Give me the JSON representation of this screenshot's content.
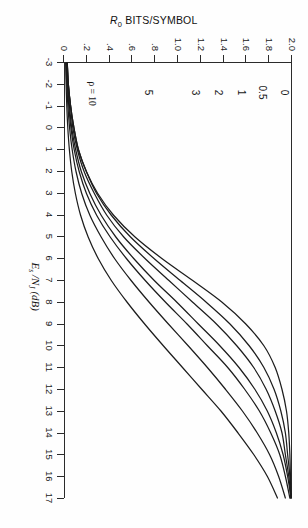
{
  "figure": {
    "background_color": "#fefefe",
    "line_color": "#1c1c1c"
  },
  "chart_data": {
    "type": "line",
    "title": "",
    "xlabel": "Es /NJ (dB)",
    "ylabel": "R0 BITS/SYMBOL",
    "xlim": [
      -3,
      17
    ],
    "ylim": [
      0,
      2.0
    ],
    "grid": false,
    "legend_position": "inline-curve-labels",
    "xticks": [
      -3,
      -2,
      -1,
      0,
      1,
      2,
      3,
      4,
      5,
      6,
      7,
      8,
      9,
      10,
      11,
      12,
      13,
      14,
      15,
      16,
      17
    ],
    "xticklabels": [
      "-3",
      "-2",
      "-1",
      "0",
      "1",
      "2",
      "3",
      "4",
      "5",
      "6",
      "7",
      "8",
      "9",
      "10",
      "11",
      "12",
      "13",
      "14",
      "15",
      "16",
      "17"
    ],
    "yticks": [
      0,
      0.2,
      0.4,
      0.6,
      0.8,
      1.0,
      1.2,
      1.4,
      1.6,
      1.8,
      2.0
    ],
    "yticklabels": [
      "0",
      ".2",
      ".4",
      ".6",
      ".8",
      "1.0",
      "1.2",
      "1.4",
      "1.6",
      "1.8",
      "2.0"
    ],
    "series": [
      {
        "name": "0",
        "label": "0",
        "label_x": -1.6,
        "label_y": 1.93,
        "points": [
          [
            -3,
            0.02
          ],
          [
            -2,
            0.03
          ],
          [
            -1,
            0.05
          ],
          [
            0,
            0.08
          ],
          [
            1,
            0.12
          ],
          [
            2,
            0.19
          ],
          [
            3,
            0.29
          ],
          [
            4,
            0.43
          ],
          [
            5,
            0.62
          ],
          [
            6,
            0.86
          ],
          [
            7,
            1.13
          ],
          [
            8,
            1.39
          ],
          [
            9,
            1.6
          ],
          [
            10,
            1.76
          ],
          [
            11,
            1.86
          ],
          [
            12,
            1.92
          ],
          [
            13,
            1.96
          ],
          [
            14,
            1.98
          ],
          [
            15,
            1.99
          ],
          [
            16,
            1.995
          ],
          [
            17,
            2.0
          ]
        ]
      },
      {
        "name": "0.5",
        "label": "0.5",
        "label_x": -1.6,
        "label_y": 1.74,
        "points": [
          [
            -3,
            0.02
          ],
          [
            -2,
            0.03
          ],
          [
            -1,
            0.05
          ],
          [
            0,
            0.08
          ],
          [
            1,
            0.12
          ],
          [
            2,
            0.19
          ],
          [
            3,
            0.28
          ],
          [
            4,
            0.41
          ],
          [
            5,
            0.58
          ],
          [
            6,
            0.79
          ],
          [
            7,
            1.02
          ],
          [
            8,
            1.25
          ],
          [
            9,
            1.46
          ],
          [
            10,
            1.63
          ],
          [
            11,
            1.76
          ],
          [
            12,
            1.85
          ],
          [
            13,
            1.91
          ],
          [
            14,
            1.95
          ],
          [
            15,
            1.97
          ],
          [
            16,
            1.99
          ],
          [
            17,
            2.0
          ]
        ]
      },
      {
        "name": "1",
        "label": "1",
        "label_x": -1.6,
        "label_y": 1.55,
        "points": [
          [
            -3,
            0.02
          ],
          [
            -2,
            0.03
          ],
          [
            -1,
            0.05
          ],
          [
            0,
            0.07
          ],
          [
            1,
            0.11
          ],
          [
            2,
            0.17
          ],
          [
            3,
            0.26
          ],
          [
            4,
            0.37
          ],
          [
            5,
            0.52
          ],
          [
            6,
            0.71
          ],
          [
            7,
            0.92
          ],
          [
            8,
            1.13
          ],
          [
            9,
            1.34
          ],
          [
            10,
            1.52
          ],
          [
            11,
            1.67
          ],
          [
            12,
            1.78
          ],
          [
            13,
            1.86
          ],
          [
            14,
            1.92
          ],
          [
            15,
            1.95
          ],
          [
            16,
            1.98
          ],
          [
            17,
            2.0
          ]
        ]
      },
      {
        "name": "2",
        "label": "2",
        "label_x": -1.6,
        "label_y": 1.35,
        "points": [
          [
            -3,
            0.015
          ],
          [
            -2,
            0.024
          ],
          [
            -1,
            0.04
          ],
          [
            0,
            0.06
          ],
          [
            1,
            0.095
          ],
          [
            2,
            0.145
          ],
          [
            3,
            0.22
          ],
          [
            4,
            0.32
          ],
          [
            5,
            0.45
          ],
          [
            6,
            0.61
          ],
          [
            7,
            0.79
          ],
          [
            8,
            0.99
          ],
          [
            9,
            1.18
          ],
          [
            10,
            1.37
          ],
          [
            11,
            1.54
          ],
          [
            12,
            1.68
          ],
          [
            13,
            1.79
          ],
          [
            14,
            1.87
          ],
          [
            15,
            1.93
          ],
          [
            16,
            1.97
          ],
          [
            17,
            2.0
          ]
        ]
      },
      {
        "name": "3",
        "label": "3",
        "label_x": -1.6,
        "label_y": 1.15,
        "points": [
          [
            -3,
            0.013
          ],
          [
            -2,
            0.021
          ],
          [
            -1,
            0.034
          ],
          [
            0,
            0.053
          ],
          [
            1,
            0.082
          ],
          [
            2,
            0.126
          ],
          [
            3,
            0.19
          ],
          [
            4,
            0.28
          ],
          [
            5,
            0.4
          ],
          [
            6,
            0.545
          ],
          [
            7,
            0.71
          ],
          [
            8,
            0.89
          ],
          [
            9,
            1.08
          ],
          [
            10,
            1.26
          ],
          [
            11,
            1.44
          ],
          [
            12,
            1.59
          ],
          [
            13,
            1.72
          ],
          [
            14,
            1.82
          ],
          [
            15,
            1.9
          ],
          [
            16,
            1.95
          ],
          [
            17,
            1.99
          ]
        ]
      },
      {
        "name": "5",
        "label": "5",
        "label_x": -1.6,
        "label_y": 0.74,
        "points": [
          [
            -3,
            0.01
          ],
          [
            -2,
            0.016
          ],
          [
            -1,
            0.026
          ],
          [
            0,
            0.041
          ],
          [
            1,
            0.064
          ],
          [
            2,
            0.098
          ],
          [
            3,
            0.148
          ],
          [
            4,
            0.22
          ],
          [
            5,
            0.32
          ],
          [
            6,
            0.44
          ],
          [
            7,
            0.585
          ],
          [
            8,
            0.745
          ],
          [
            9,
            0.915
          ],
          [
            10,
            1.09
          ],
          [
            11,
            1.26
          ],
          [
            12,
            1.42
          ],
          [
            13,
            1.57
          ],
          [
            14,
            1.7
          ],
          [
            15,
            1.81
          ],
          [
            16,
            1.89
          ],
          [
            17,
            1.95
          ]
        ]
      },
      {
        "name": "10",
        "label": "ρ = 10",
        "label_x": -1.55,
        "label_y": 0.25,
        "points": [
          [
            -3,
            0.006
          ],
          [
            -2,
            0.01
          ],
          [
            -1,
            0.016
          ],
          [
            0,
            0.025
          ],
          [
            1,
            0.039
          ],
          [
            2,
            0.06
          ],
          [
            3,
            0.092
          ],
          [
            4,
            0.138
          ],
          [
            5,
            0.205
          ],
          [
            6,
            0.295
          ],
          [
            7,
            0.41
          ],
          [
            8,
            0.55
          ],
          [
            9,
            0.705
          ],
          [
            10,
            0.87
          ],
          [
            11,
            1.04
          ],
          [
            12,
            1.21
          ],
          [
            13,
            1.38
          ],
          [
            14,
            1.53
          ],
          [
            15,
            1.67
          ],
          [
            16,
            1.79
          ],
          [
            17,
            1.88
          ]
        ]
      }
    ]
  }
}
